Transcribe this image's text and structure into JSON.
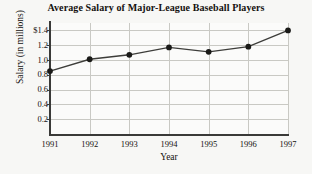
{
  "chart_data": {
    "type": "line",
    "title": "Average Salary of Major-League Baseball Players",
    "xlabel": "Year",
    "ylabel": "Salary (in millions)",
    "categories": [
      "1991",
      "1992",
      "1993",
      "1994",
      "1995",
      "1996",
      "1997"
    ],
    "x": [
      1991,
      1992,
      1993,
      1994,
      1995,
      1996,
      1997
    ],
    "values": [
      0.85,
      1.01,
      1.07,
      1.17,
      1.11,
      1.18,
      1.4
    ],
    "series": [
      {
        "name": "Average Salary",
        "values": [
          0.85,
          1.01,
          1.07,
          1.17,
          1.11,
          1.18,
          1.4
        ]
      }
    ],
    "ytick_labels": [
      "$1.4",
      "1.2",
      "1.0",
      "0.8",
      "0.6",
      "0.4",
      "0.2"
    ],
    "ytick_values": [
      1.4,
      1.2,
      1.0,
      0.8,
      0.6,
      0.4,
      0.2
    ],
    "xtick_labels": [
      "1991",
      "1992",
      "1993",
      "1994",
      "1995",
      "1996",
      "1997"
    ],
    "ylim": [
      0.0,
      1.5
    ],
    "xlim": [
      1991,
      1997
    ],
    "grid": true,
    "legend": "none",
    "marker": "filled-circle",
    "colors": {
      "line": "#3d3d3a",
      "marker": "#1a1a18",
      "grid": "#c9c9c4",
      "axis": "#3a3a38",
      "background": "#f7f7f5",
      "plot_background": "#fbfbfa",
      "text": "#14110f"
    }
  }
}
